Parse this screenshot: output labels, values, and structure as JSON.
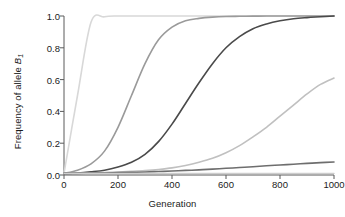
{
  "chart_data": {
    "type": "line",
    "title": "",
    "xlabel": "Generation",
    "ylabel": "Frequency of allele B1",
    "ylabel_parts": {
      "prefix": "Frequency of allele ",
      "symbol": "B",
      "subscript": "1"
    },
    "xlim": [
      0,
      1000
    ],
    "ylim": [
      0.0,
      1.0
    ],
    "xticks": [
      0,
      200,
      400,
      600,
      800,
      1000
    ],
    "xticklabels": [
      "0",
      "200",
      "400",
      "600",
      "800",
      "1000"
    ],
    "yticks": [
      0.0,
      0.2,
      0.4,
      0.6,
      0.8,
      1.0
    ],
    "yticklabels": [
      "0.0",
      "0.2",
      "0.4",
      "0.6",
      "0.8",
      "1.0"
    ],
    "grid": false,
    "legend": "none",
    "x": [
      0,
      50,
      100,
      150,
      200,
      250,
      300,
      350,
      400,
      450,
      500,
      550,
      600,
      650,
      700,
      750,
      800,
      850,
      900,
      950,
      1000
    ],
    "series": [
      {
        "name": "curve-1-strongest-selection",
        "color": "#d8d8d8",
        "linewidth": 1.6,
        "values": [
          0.01,
          0.5,
          0.96,
          0.995,
          1.0,
          1.0,
          1.0,
          1.0,
          1.0,
          1.0,
          1.0,
          1.0,
          1.0,
          1.0,
          1.0,
          1.0,
          1.0,
          1.0,
          1.0,
          1.0,
          1.0
        ]
      },
      {
        "name": "curve-2-strong-selection",
        "color": "#9a9a9a",
        "linewidth": 1.6,
        "values": [
          0.01,
          0.03,
          0.07,
          0.15,
          0.3,
          0.5,
          0.7,
          0.85,
          0.93,
          0.97,
          0.985,
          0.993,
          0.997,
          0.998,
          0.999,
          1.0,
          1.0,
          1.0,
          1.0,
          1.0,
          1.0
        ]
      },
      {
        "name": "curve-3-moderate-selection",
        "color": "#4a4a4a",
        "linewidth": 1.6,
        "values": [
          0.01,
          0.013,
          0.02,
          0.03,
          0.05,
          0.08,
          0.13,
          0.21,
          0.32,
          0.45,
          0.58,
          0.7,
          0.8,
          0.87,
          0.92,
          0.95,
          0.97,
          0.983,
          0.99,
          0.995,
          1.0
        ]
      },
      {
        "name": "curve-4-weak-selection",
        "color": "#c0c0c0",
        "linewidth": 1.6,
        "values": [
          0.01,
          0.011,
          0.013,
          0.016,
          0.019,
          0.023,
          0.028,
          0.035,
          0.045,
          0.06,
          0.08,
          0.105,
          0.14,
          0.185,
          0.24,
          0.3,
          0.37,
          0.44,
          0.51,
          0.57,
          0.61
        ]
      },
      {
        "name": "curve-5-very-weak-selection",
        "color": "#6e6e6e",
        "linewidth": 1.6,
        "values": [
          0.01,
          0.0105,
          0.012,
          0.013,
          0.015,
          0.017,
          0.019,
          0.022,
          0.025,
          0.029,
          0.032,
          0.037,
          0.042,
          0.047,
          0.052,
          0.058,
          0.063,
          0.068,
          0.073,
          0.078,
          0.082
        ]
      },
      {
        "name": "curve-6-neutral",
        "color": "#cdcdcd",
        "linewidth": 1.4,
        "values": [
          0.01,
          0.01,
          0.01,
          0.01,
          0.01,
          0.01,
          0.01,
          0.01,
          0.01,
          0.01,
          0.01,
          0.01,
          0.01,
          0.01,
          0.01,
          0.01,
          0.01,
          0.01,
          0.01,
          0.01,
          0.01
        ]
      }
    ]
  },
  "axes": {
    "x_label": "Generation",
    "y_label_prefix": "Frequency of allele ",
    "y_label_symbol": "B",
    "y_label_sub": "1",
    "x_tick_0": "0",
    "x_tick_1": "200",
    "x_tick_2": "400",
    "x_tick_3": "600",
    "x_tick_4": "800",
    "x_tick_5": "1000",
    "y_tick_0": "0.0",
    "y_tick_1": "0.2",
    "y_tick_2": "0.4",
    "y_tick_3": "0.6",
    "y_tick_4": "0.8",
    "y_tick_5": "1.0"
  }
}
